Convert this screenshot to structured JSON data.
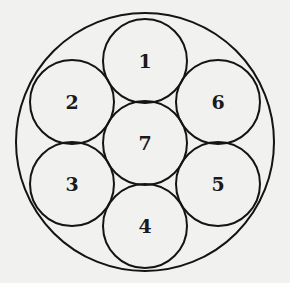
{
  "diagram": {
    "outer_circle": {
      "cx": 145,
      "cy": 142,
      "r": 129
    },
    "circles": [
      {
        "label": "1",
        "cx": 145,
        "cy": 61,
        "r": 42
      },
      {
        "label": "2",
        "cx": 72,
        "cy": 102,
        "r": 42
      },
      {
        "label": "3",
        "cx": 72,
        "cy": 184,
        "r": 42
      },
      {
        "label": "4",
        "cx": 145,
        "cy": 226,
        "r": 42
      },
      {
        "label": "5",
        "cx": 218,
        "cy": 184,
        "r": 42
      },
      {
        "label": "6",
        "cx": 218,
        "cy": 102,
        "r": 42
      },
      {
        "label": "7",
        "cx": 145,
        "cy": 143,
        "r": 42
      }
    ]
  }
}
